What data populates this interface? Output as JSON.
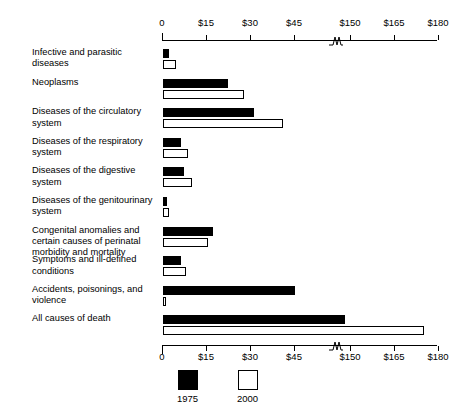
{
  "chart_data": {
    "type": "bar",
    "title": "",
    "subtitle": "",
    "xlabel": "",
    "ylabel": "",
    "orientation": "horizontal",
    "grid": false,
    "axis_break": true,
    "axis_break_between": [
      45,
      150
    ],
    "xlim": [
      0,
      180
    ],
    "tick_labels": [
      "0",
      "$15",
      "$30",
      "$45",
      "$150",
      "$165",
      "$180"
    ],
    "tick_values": [
      0,
      15,
      30,
      45,
      150,
      165,
      180
    ],
    "legend_position": "bottom",
    "categories": [
      "Infective and parasitic diseases",
      "Neoplasms",
      "Diseases of the circulatory system",
      "Diseases of the respiratory system",
      "Diseases of the digestive system",
      "Diseases of the genitourinary system",
      "Congenital anomalies and certain causes of perinatal morbidity and mortality",
      "Symptoms and ill-defined conditions",
      "Accidents, poisonings, and violence",
      "All causes of death"
    ],
    "series": [
      {
        "name": "1975",
        "color": "#000000",
        "values": [
          2.0,
          22.0,
          31.0,
          6.0,
          7.0,
          1.5,
          17.0,
          6.0,
          45.0,
          148.0
        ]
      },
      {
        "name": "2000",
        "color": "#ffffff",
        "values": [
          4.5,
          27.5,
          41.0,
          8.5,
          10.0,
          2.0,
          15.5,
          8.0,
          47.0,
          175.0
        ]
      }
    ]
  },
  "legend": {
    "items": [
      {
        "label": "1975",
        "swatch": "filled-black-square"
      },
      {
        "label": "2000",
        "swatch": "open-white-square"
      }
    ]
  },
  "axis": {
    "top_labels": [
      "0",
      "$15",
      "$30",
      "$45",
      "$150",
      "$165",
      "$180"
    ],
    "bottom_labels": [
      "0",
      "$15",
      "$30",
      "$45",
      "$150",
      "$165",
      "$180"
    ]
  }
}
